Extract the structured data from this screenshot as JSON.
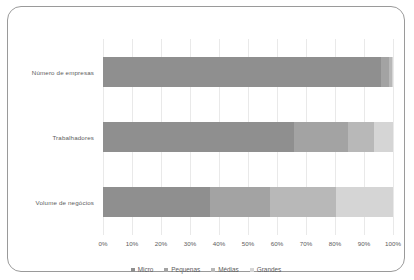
{
  "chart_data": {
    "type": "bar",
    "orientation": "horizontal",
    "stacked": true,
    "normalized": "100%",
    "title": "",
    "xlabel": "",
    "ylabel": "",
    "xlim": [
      0,
      100
    ],
    "grid": true,
    "legend_position": "bottom",
    "categories": [
      "Número de empresas",
      "Trabalhadores",
      "Volume de negócios"
    ],
    "tick_labels": [
      "0%",
      "10%",
      "20%",
      "30%",
      "40%",
      "50%",
      "60%",
      "70%",
      "80%",
      "90%",
      "100%"
    ],
    "tick_values": [
      0,
      10,
      20,
      30,
      40,
      50,
      60,
      70,
      80,
      90,
      100
    ],
    "series": [
      {
        "name": "Micro",
        "color": "#8f8f8f",
        "values": [
          96.0,
          66.0,
          37.0
        ]
      },
      {
        "name": "Pequenas",
        "color": "#a3a3a3",
        "values": [
          2.6,
          18.5,
          20.5
        ]
      },
      {
        "name": "Médias",
        "color": "#b8b8b8",
        "values": [
          1.0,
          9.0,
          23.0
        ]
      },
      {
        "name": "Grandes",
        "color": "#d5d5d5",
        "values": [
          0.4,
          6.5,
          19.5
        ]
      }
    ]
  },
  "legend": {
    "items": [
      {
        "label": "Micro"
      },
      {
        "label": "Pequenas"
      },
      {
        "label": "Médias"
      },
      {
        "label": "Grandes"
      }
    ]
  },
  "colors": {
    "frame_border": "#9a9a9a",
    "gridline": "#e9e9e9",
    "text": "#5c5c5c",
    "background": "#ffffff"
  }
}
